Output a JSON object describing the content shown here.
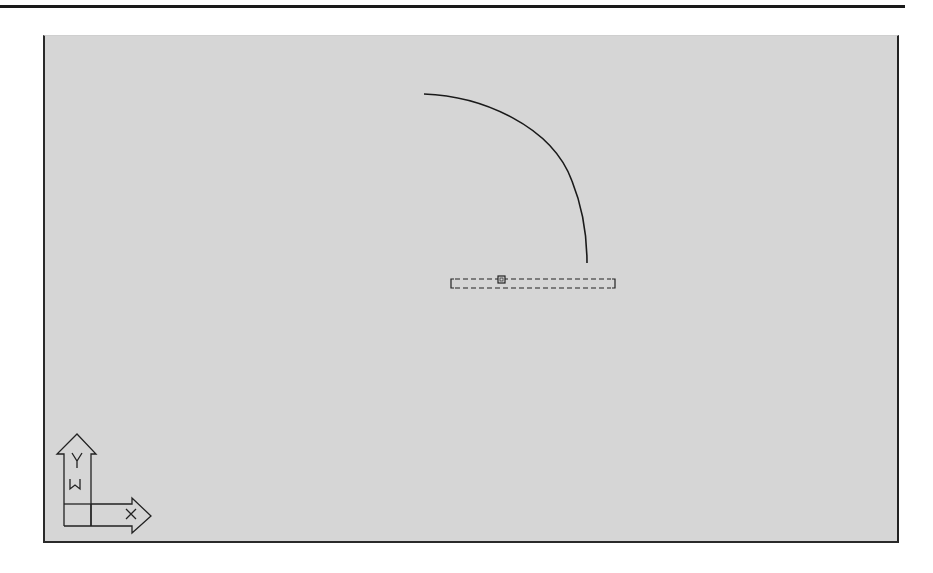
{
  "app": {
    "type": "CAD drawing viewport"
  },
  "viewport": {
    "background": "#d6d6d6",
    "border_color": "#2a2a2a"
  },
  "entities": {
    "arc": {
      "start": [
        422,
        93
      ],
      "end": [
        585,
        262
      ],
      "color": "#1a1a1a"
    },
    "selection_box": {
      "x1": 449,
      "y1": 278,
      "x2": 613,
      "y2": 287,
      "style": "dashed",
      "grip_x": 499
    }
  },
  "ucs_icon": {
    "y_label": "Y",
    "x_label": "X",
    "w_label": "W"
  }
}
